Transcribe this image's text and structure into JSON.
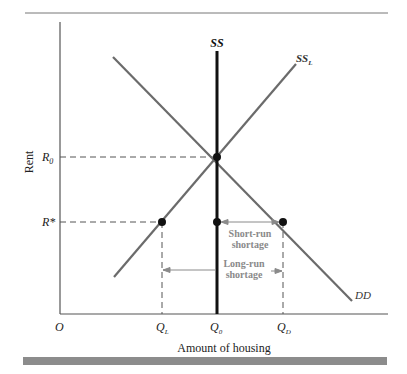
{
  "diagram": {
    "type": "supply-demand-rent-control",
    "axes": {
      "x_label": "Amount of housing",
      "y_label": "Rent",
      "origin_label": "O"
    },
    "x_ticks": [
      {
        "id": "QL",
        "main": "Q",
        "sub": "L"
      },
      {
        "id": "Q0",
        "main": "Q",
        "sub": "0"
      },
      {
        "id": "QD",
        "main": "Q",
        "sub": "D"
      }
    ],
    "y_ticks": [
      {
        "id": "R0",
        "main": "R",
        "sub": "0"
      },
      {
        "id": "Rstar",
        "main": "R*",
        "sub": ""
      }
    ],
    "curves": [
      {
        "id": "SS",
        "label": "SS",
        "sub": "",
        "kind": "short-run supply (vertical)"
      },
      {
        "id": "SSL",
        "label": "SS",
        "sub": "L",
        "kind": "long-run supply"
      },
      {
        "id": "DD",
        "label": "DD",
        "sub": "",
        "kind": "demand"
      }
    ],
    "annotations": {
      "short_run": [
        "Short-run",
        "shortage"
      ],
      "long_run": [
        "Long-run",
        "shortage"
      ]
    },
    "colors": {
      "axis": "#555555",
      "curve": "#6b6b6b",
      "ss": "#111111",
      "dash": "#555555",
      "annotation": "#8a8a8a",
      "bottom_bar": "#8c8c8c",
      "top_rule": "#777777"
    }
  }
}
